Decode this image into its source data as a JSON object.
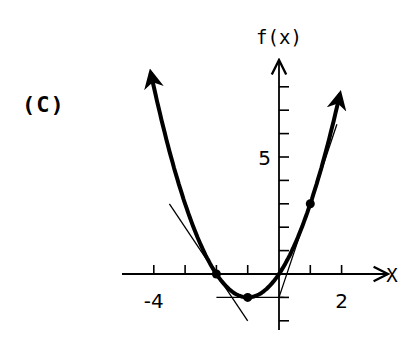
{
  "panel_label": "(C)",
  "chart_data": {
    "type": "line",
    "title": "",
    "xlabel": "x",
    "ylabel": "f(x)",
    "xlim": [
      -4.3,
      2.2
    ],
    "ylim": [
      -2.5,
      9
    ],
    "grid": false,
    "x_tick_labels": [
      {
        "value": -4,
        "label": "-4"
      },
      {
        "value": 2,
        "label": "2"
      }
    ],
    "y_tick_labels": [
      {
        "value": 5,
        "label": "5"
      }
    ],
    "x_ticks": [
      -4,
      -3,
      -2,
      -1,
      0,
      1,
      2
    ],
    "y_ticks": [
      -2,
      -1,
      1,
      2,
      3,
      4,
      5,
      6,
      7,
      8
    ],
    "series": [
      {
        "name": "f(x) = x^2 + 2x",
        "style": "thick solid with arrowheads",
        "x": [
          -4.1,
          -4,
          -3.5,
          -3,
          -2.5,
          -2,
          -1.5,
          -1,
          -0.5,
          0,
          0.5,
          1,
          1.5,
          1.95
        ],
        "values": [
          8.61,
          8,
          5.25,
          3,
          1.25,
          0,
          -0.75,
          -1,
          -0.75,
          0,
          1.25,
          3,
          5.25,
          7.7
        ]
      },
      {
        "name": "tangent at x=-2",
        "style": "thin",
        "x": [
          -3.5,
          -1
        ],
        "values": [
          3,
          -2
        ]
      },
      {
        "name": "tangent at x=-1",
        "style": "thin horizontal",
        "x": [
          -2.0,
          0.15
        ],
        "values": [
          -1,
          -1
        ]
      },
      {
        "name": "tangent at x=1",
        "style": "thin",
        "x": [
          0,
          1.85
        ],
        "values": [
          -1,
          6.4
        ]
      }
    ],
    "marked_points": [
      {
        "x": -2,
        "y": 0
      },
      {
        "x": -1,
        "y": -1
      },
      {
        "x": 1,
        "y": 3
      }
    ]
  }
}
